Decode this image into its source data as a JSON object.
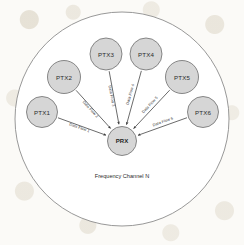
{
  "diagram": {
    "caption": "Frequency Channel N",
    "cell": {
      "cx": 122,
      "cy": 119,
      "r": 107,
      "stroke": "#8c8c8c",
      "fill": "#ffffff"
    },
    "node_style": {
      "fill": "#d6d6d6",
      "stroke": "#7a7a7a"
    },
    "hub": {
      "id": "PRX",
      "label": "PRX",
      "cx": 122,
      "cy": 141,
      "r": 14.5
    },
    "nodes": [
      {
        "id": "PTX1",
        "label": "PTX1",
        "cx": 42,
        "cy": 112,
        "r": 15.5
      },
      {
        "id": "PTX2",
        "label": "PTX2",
        "cx": 64,
        "cy": 77,
        "r": 16.5
      },
      {
        "id": "PTX3",
        "label": "PTX3",
        "cx": 106,
        "cy": 54,
        "r": 16.0
      },
      {
        "id": "PTX4",
        "label": "PTX4",
        "cx": 146,
        "cy": 54,
        "r": 16.0
      },
      {
        "id": "PTX5",
        "label": "PTX5",
        "cx": 182,
        "cy": 77,
        "r": 16.5
      },
      {
        "id": "PTX6",
        "label": "PTX6",
        "cx": 203,
        "cy": 112,
        "r": 15.5
      }
    ],
    "flows": [
      {
        "id": "flow-1",
        "label": "Data Flow 1",
        "from": "PTX1",
        "to": "PRX",
        "direction": "into-hub"
      },
      {
        "id": "flow-2",
        "label": "Data Flow 2",
        "from": "PTX2",
        "to": "PRX",
        "direction": "into-hub"
      },
      {
        "id": "flow-3",
        "label": "Data Flow 3",
        "from": "PTX3",
        "to": "PRX",
        "direction": "into-hub"
      },
      {
        "id": "flow-4",
        "label": "Data Flow 4",
        "from": "PTX4",
        "to": "PRX",
        "direction": "into-hub"
      },
      {
        "id": "flow-5",
        "label": "Data Flow 5",
        "from": "PTX5",
        "to": "PRX",
        "direction": "into-hub"
      },
      {
        "id": "flow-6",
        "label": "Data Flow 6",
        "from": "PTX6",
        "to": "PRX",
        "direction": "into-hub"
      }
    ]
  }
}
